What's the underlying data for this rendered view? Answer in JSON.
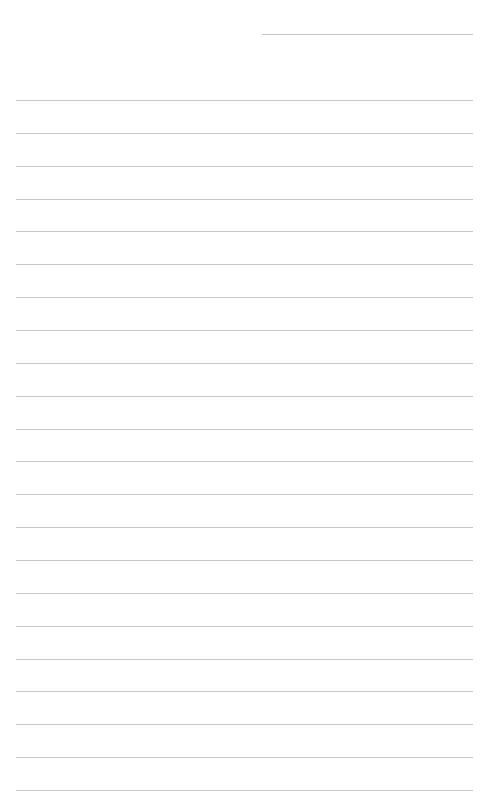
{
  "page": {
    "type": "lined-paper",
    "background_color": "#ffffff",
    "line_color": "#c8c8c8",
    "header_line": {
      "present": true
    },
    "rule_count": 22
  }
}
